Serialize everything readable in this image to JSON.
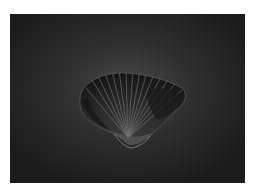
{
  "image": {
    "subject": "seashell",
    "description": "Dark ribbed bivalve shell photographed on a dark vignette background",
    "colors": {
      "background_center": "#4a4a4a",
      "background_edge": "#1a1a1a",
      "page_background": "#ffffff",
      "shell_dark": "#1c1c1c",
      "shell_rib": "#9a9a9a"
    }
  }
}
